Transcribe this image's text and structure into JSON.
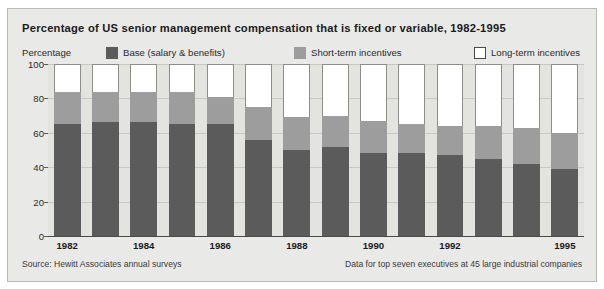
{
  "panel": {
    "background_color": "#e9e9e7",
    "border_color": "#b9b9b5"
  },
  "title": "Percentage of US senior management compensation that is fixed or variable, 1982-1995",
  "axis_name": "Percentage",
  "legend": [
    {
      "label": "Base (salary & benefits)",
      "color": "#5b5b5b",
      "key": "base"
    },
    {
      "label": "Short-term incentives",
      "color": "#9d9d9d",
      "key": "short_term"
    },
    {
      "label": "Long-term incentives",
      "color": "#ffffff",
      "key": "long_term"
    }
  ],
  "footer": {
    "source": "Source: Hewitt Associates annual surveys",
    "note": "Data for top seven executives at 45 large industrial companies"
  },
  "chart_data": {
    "type": "bar",
    "subtype": "stacked-column-100",
    "title": "Percentage of US senior management compensation that is fixed or variable, 1982-1995",
    "xlabel": "",
    "ylabel": "Percentage",
    "ylim": [
      0,
      100
    ],
    "yticks": [
      0,
      20,
      40,
      60,
      80,
      100
    ],
    "ytick_labels": [
      "0",
      "20",
      "40",
      "60",
      "80",
      "100"
    ],
    "grid": true,
    "legend_position": "top",
    "categories": [
      "1982",
      "1983",
      "1984",
      "1985",
      "1986",
      "1987",
      "1988",
      "1989",
      "1990",
      "1991",
      "1992",
      "1993",
      "1994",
      "1995"
    ],
    "xtick_labels_shown": [
      "1982",
      "1984",
      "1986",
      "1988",
      "1990",
      "1992",
      "1995"
    ],
    "series": [
      {
        "name": "Base (salary & benefits)",
        "color": "#5b5b5b",
        "values": [
          65,
          66,
          66,
          65,
          65,
          56,
          50,
          52,
          48,
          48,
          47,
          45,
          42,
          39
        ]
      },
      {
        "name": "Short-term incentives",
        "color": "#9d9d9d",
        "values": [
          19,
          18,
          18,
          19,
          16,
          19,
          19,
          18,
          19,
          17,
          17,
          19,
          21,
          21
        ]
      },
      {
        "name": "Long-term incentives",
        "color": "#ffffff",
        "values": [
          16,
          16,
          16,
          16,
          19,
          25,
          31,
          30,
          33,
          35,
          36,
          36,
          37,
          40
        ]
      }
    ]
  }
}
